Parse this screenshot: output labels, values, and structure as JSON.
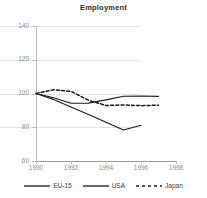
{
  "chart_data": {
    "type": "line",
    "title": "Employment",
    "xlabel": "",
    "ylabel": "",
    "xlim": [
      1990,
      1998
    ],
    "ylim": [
      60,
      140
    ],
    "xticks": [
      1990,
      1992,
      1994,
      1996,
      1998
    ],
    "yticks": [
      60,
      80,
      100,
      120,
      140
    ],
    "grid": true,
    "legend_position": "bottom",
    "series": [
      {
        "name": "EU-15",
        "style": "solid",
        "color": "#1a1a1a",
        "x": [
          1990,
          1991,
          1992,
          1993,
          1994,
          1995,
          1996,
          1997
        ],
        "values": [
          100,
          97.5,
          94.2,
          94.3,
          96.2,
          98.4,
          98.5,
          98.3
        ]
      },
      {
        "name": "USA",
        "style": "solid",
        "color": "#1a1a1a",
        "x": [
          1990,
          1991,
          1992,
          1993,
          1994,
          1995,
          1996
        ],
        "values": [
          100,
          96.5,
          92.0,
          87.5,
          83.0,
          78.4,
          81.2
        ]
      },
      {
        "name": "Japan",
        "style": "dashed",
        "color": "#1a1a1a",
        "x": [
          1990,
          1991,
          1992,
          1993,
          1994,
          1995,
          1996,
          1997
        ],
        "values": [
          100,
          102.2,
          101.3,
          96.0,
          92.9,
          93.2,
          92.8,
          93.1
        ]
      }
    ]
  },
  "axis": {
    "y_tick_labels": [
      "140",
      "120",
      "100",
      "80",
      "60"
    ],
    "x_tick_labels": [
      "1990",
      "1992",
      "1994",
      "1996",
      "1998"
    ]
  },
  "legend": {
    "items": [
      {
        "label": "EU-15",
        "style": "solid"
      },
      {
        "label": "USA",
        "style": "solid"
      },
      {
        "label": "Japan",
        "style": "dashed"
      }
    ]
  }
}
